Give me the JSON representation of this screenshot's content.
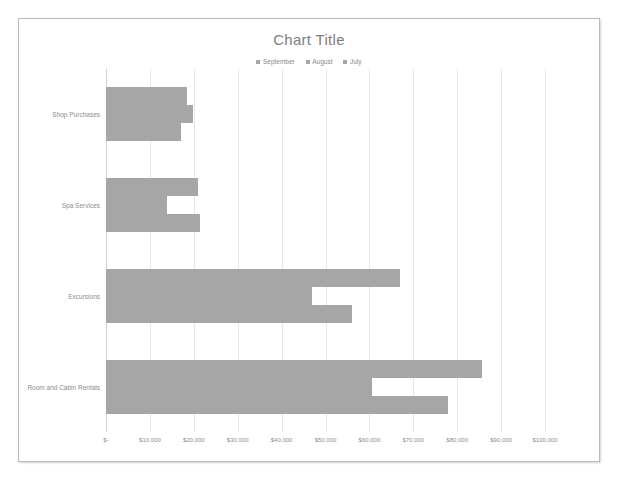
{
  "chart_data": {
    "type": "bar",
    "orientation": "horizontal",
    "title": "Chart Title",
    "xlabel": "",
    "ylabel": "",
    "categories": [
      "Shop Purchases",
      "Spa Services",
      "Excursions",
      "Room and Cabin Rentals"
    ],
    "series": [
      {
        "name": "July",
        "color": "#a6a6a6",
        "values": [
          17000,
          21500,
          56000,
          78000
        ]
      },
      {
        "name": "August",
        "color": "#a6a6a6",
        "values": [
          19800,
          14000,
          47000,
          60500
        ]
      },
      {
        "name": "September",
        "color": "#a6a6a6",
        "values": [
          18500,
          21000,
          67000,
          85700
        ]
      }
    ],
    "legend": [
      {
        "label": "September",
        "color": "#a6a6a6"
      },
      {
        "label": "August",
        "color": "#a6a6a6"
      },
      {
        "label": "July",
        "color": "#a6a6a6"
      }
    ],
    "legend_position": "top",
    "xlim": [
      0,
      100000
    ],
    "x_ticks": [
      0,
      10000,
      20000,
      30000,
      40000,
      50000,
      60000,
      70000,
      80000,
      90000,
      100000
    ],
    "x_tick_labels": [
      "$-",
      "$10,000",
      "$20,000",
      "$30,000",
      "$40,000",
      "$50,000",
      "$60,000",
      "$70,000",
      "$80,000",
      "$90,000",
      "$100,000"
    ],
    "grid": true,
    "grid_axis": "x",
    "bar_color": "#a6a6a6",
    "plot_background": "#ffffff"
  }
}
